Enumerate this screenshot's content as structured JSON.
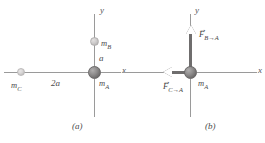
{
  "figure": {
    "type": "physics-free-body-diagram",
    "panels": [
      {
        "id": "a",
        "caption": "(a)",
        "axes": {
          "x_label": "x",
          "y_label": "y"
        },
        "masses": [
          {
            "name": "mass-a",
            "label_main": "m",
            "label_sub": "A",
            "position": "origin"
          },
          {
            "name": "mass-b",
            "label_main": "m",
            "label_sub": "B",
            "position": "positive-y"
          },
          {
            "name": "mass-c",
            "label_main": "m",
            "label_sub": "C",
            "position": "negative-x"
          }
        ],
        "distances": [
          {
            "name": "distance-a",
            "label": "a",
            "between": "mass-A to mass-B"
          },
          {
            "name": "distance-2a",
            "label": "2a",
            "between": "mass-A to mass-C"
          }
        ]
      },
      {
        "id": "b",
        "caption": "(b)",
        "axes": {
          "x_label": "x",
          "y_label": "y"
        },
        "masses": [
          {
            "name": "mass-a",
            "label_main": "m",
            "label_sub": "A",
            "position": "origin"
          }
        ],
        "forces": [
          {
            "name": "force-b-on-a",
            "symbol": "F",
            "arrow": "→",
            "subscript": "B→A",
            "direction": "up"
          },
          {
            "name": "force-c-on-a",
            "symbol": "F",
            "arrow": "→",
            "subscript": "C→A",
            "direction": "left"
          }
        ]
      }
    ],
    "colors": {
      "axis": "#9a9a9a",
      "mass_a_fill": "#8e8c8c",
      "mass_b_fill": "#cfcdcd",
      "mass_c_fill": "#d8d6d6",
      "vector_shaft": "#6f6d6d",
      "text": "#4a4a4a",
      "background": "#ffffff"
    }
  }
}
